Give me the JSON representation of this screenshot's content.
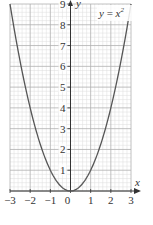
{
  "chart_data": {
    "type": "line",
    "title": "",
    "function": "y = x^2",
    "xlabel": "x",
    "ylabel": "y",
    "xlim": [
      -3,
      3
    ],
    "ylim": [
      0,
      9
    ],
    "grid": true,
    "minor_grid_step": 0.2,
    "x_ticks": [
      -3,
      -2,
      -1,
      0,
      1,
      2,
      3
    ],
    "y_ticks": [
      1,
      2,
      3,
      4,
      5,
      6,
      7,
      8,
      9
    ],
    "x_tick_labels": [
      "−3",
      "−2",
      "−1",
      "0",
      "1",
      "2",
      "3"
    ],
    "y_tick_labels": [
      "1",
      "2",
      "3",
      "4",
      "5",
      "6",
      "7",
      "8",
      "9"
    ],
    "series": [
      {
        "name": "y = x²",
        "x": [
          -3,
          -2.5,
          -2,
          -1.5,
          -1,
          -0.5,
          0,
          0.5,
          1,
          1.5,
          2,
          2.5,
          3
        ],
        "values": [
          9,
          6.25,
          4,
          2.25,
          1,
          0.25,
          0,
          0.25,
          1,
          2.25,
          4,
          6.25,
          9
        ]
      }
    ],
    "annotations": [
      {
        "text": "y = x²",
        "position": "upper right inside plot"
      }
    ],
    "colors": {
      "curve": "#555555",
      "axis": "#333333",
      "major_grid": "#b0b0b0",
      "minor_grid": "#dcdcdc"
    }
  },
  "labels": {
    "func_y": "y",
    "func_eq": " = ",
    "func_x": "x",
    "func_exp": "2",
    "x_axis": "x",
    "y_axis": "y"
  }
}
